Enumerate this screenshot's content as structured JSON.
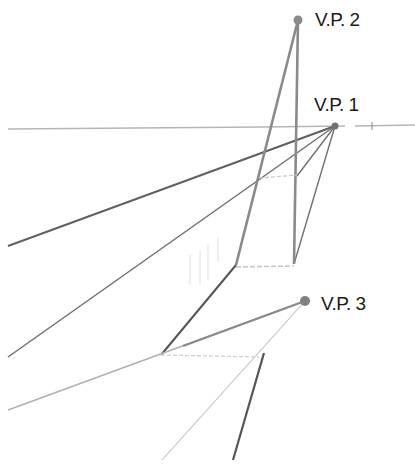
{
  "diagram": {
    "type": "three-point perspective construction",
    "vanishing_points": [
      {
        "id": "vp1",
        "label": "V.P. 1",
        "x": 335,
        "y": 126
      },
      {
        "id": "vp2",
        "label": "V.P. 2",
        "x": 298,
        "y": 20
      },
      {
        "id": "vp3",
        "label": "V.P. 3",
        "x": 305,
        "y": 301
      }
    ],
    "colors": {
      "dark_line": "#555555",
      "medium_line": "#8a8a8a",
      "light_line": "#b5b5b5",
      "faint_line": "#d0d0d0",
      "dot": "#808080",
      "label": "#1a1a1a"
    }
  }
}
